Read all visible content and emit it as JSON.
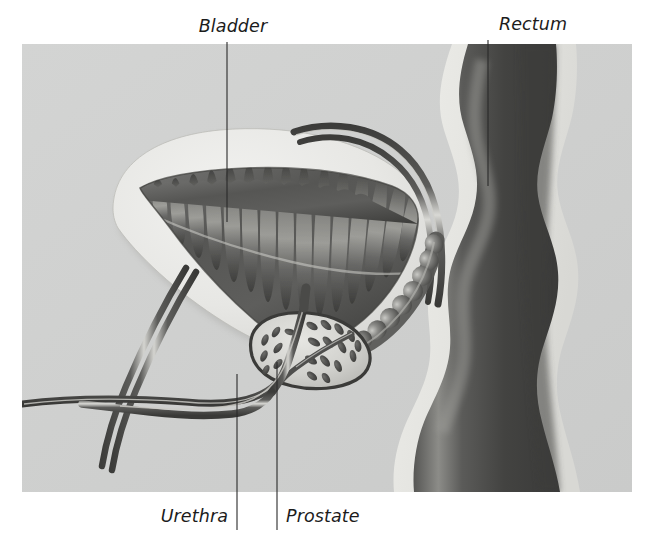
{
  "figure": {
    "name": "male-pelvic-anatomy-cross-section",
    "background_color": "#ffffff",
    "panel": {
      "x": 22,
      "y": 44,
      "width": 610,
      "height": 448,
      "fill_color": "#cfd0cf"
    }
  },
  "labels": {
    "bladder": {
      "text": "Bladder",
      "x": 233,
      "y": 32,
      "anchor": "middle",
      "leader": {
        "x1": 227,
        "y1": 42,
        "x2": 227,
        "y2": 222
      }
    },
    "rectum": {
      "text": "Rectum",
      "x": 533,
      "y": 30,
      "anchor": "middle",
      "leader": {
        "x1": 488,
        "y1": 40,
        "x2": 488,
        "y2": 186
      }
    },
    "urethra": {
      "text": "Urethra",
      "x": 228,
      "y": 522,
      "anchor": "end",
      "leader": {
        "x1": 237,
        "y1": 374,
        "x2": 237,
        "y2": 530
      }
    },
    "prostate": {
      "text": "Prostate",
      "x": 286,
      "y": 522,
      "anchor": "start",
      "leader": {
        "x1": 277,
        "y1": 362,
        "x2": 277,
        "y2": 530
      }
    }
  },
  "structures": [
    {
      "name": "bladder",
      "label": "Bladder",
      "description": "Urinary bladder shown in cross section with a pale smooth muscular wall and a dark rugose (folded) inner lumen",
      "wall_color": "#e9e9e7",
      "lumen_color": "#5f5f5d"
    },
    {
      "name": "bladder-lumen-rugae",
      "label": "Bladder rugae",
      "description": "Scalloped folds lining the interior of the bladder",
      "fold_count": 16,
      "color": "#4e4e4c"
    },
    {
      "name": "rectum",
      "label": "Rectum",
      "description": "Rectum shown as a dark wavy vertical column with a pale serosal outer wall",
      "wall_color": "#e2e2de",
      "lumen_color": "#474746",
      "highlight_color": "#8d8d8a"
    },
    {
      "name": "prostate",
      "label": "Prostate",
      "description": "Prostate gland shown as a shield shape with radiating teardrop-shaped glandular lobules surrounding the urethra",
      "outline_color": "#3a3a38",
      "fill_color": "#d6d6d2",
      "lobule_color": "#4b4b49",
      "lobule_count": 22
    },
    {
      "name": "seminal-vesicle",
      "label": "Seminal vesicle",
      "description": "Beaded lobulated seminal vesicle running postero-superiorly from the prostate",
      "color": "#6a6a68",
      "bead_count": 9
    },
    {
      "name": "urethra",
      "label": "Urethra",
      "description": "Urethra passing from the bladder neck through the prostate and curving antero-inferiorly",
      "color": "#6e6e6c"
    },
    {
      "name": "ureter",
      "label": "Ureter",
      "description": "Tubular ureter arching over the superior bladder surface toward the bladder",
      "color": "#6e6e6c"
    },
    {
      "name": "vas-deferens",
      "label": "Vas deferens",
      "description": "Paired tubular ducts crossing the lower left of the field toward the prostate",
      "color": "#6e6e6c"
    }
  ],
  "palette": {
    "page_background": "#ffffff",
    "panel_background": "#cfd0cf",
    "label_text": "#1c1c1c",
    "leader_line": "#2a2a2a",
    "tissue_light": "#e9e9e7",
    "tissue_mid": "#9a9a97",
    "tissue_dark": "#4a4a48"
  }
}
